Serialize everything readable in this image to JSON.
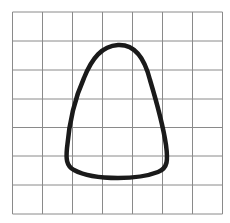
{
  "diagram": {
    "type": "shape-on-grid",
    "grid": {
      "columns": 7,
      "rows": 7,
      "x_lines": [
        12.5,
        42.5,
        72.5,
        102.5,
        132.5,
        162.5,
        192.5,
        222.5
      ],
      "y_lines": [
        12,
        41,
        70,
        99,
        127.5,
        156,
        185,
        214
      ],
      "line_color": "#8a8a8a",
      "line_width": 1
    },
    "shape": {
      "name": "rounded-bell-loop",
      "stroke_color": "#1a1a1a",
      "stroke_width": 4.5,
      "fill": "none",
      "path": "M118,45 C136,44 145,60 150,80 C156,100 163,125 166,145 C168,160 168,168 158,172 C145,177 130,178 118,178 C102,178 85,176 74,170 C66,166 66,158 67,148 C69,125 74,100 84,78 C92,58 102,46 118,45 Z"
    }
  }
}
